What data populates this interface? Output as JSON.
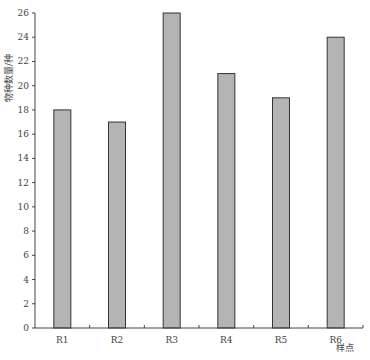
{
  "chart_data": {
    "type": "bar",
    "title": "",
    "xlabel": "样点",
    "ylabel": "物种数量/种",
    "categories": [
      "R1",
      "R2",
      "R3",
      "R4",
      "R5",
      "R6"
    ],
    "values": [
      18,
      17,
      26,
      21,
      19,
      24
    ],
    "ylim": [
      0,
      26
    ],
    "yticks": [
      0,
      2,
      4,
      6,
      8,
      10,
      12,
      14,
      16,
      18,
      20,
      22,
      24,
      26
    ],
    "grid": false,
    "legend": null,
    "bar_color": "#b4b4b4",
    "bar_edge_color": "#333333"
  }
}
